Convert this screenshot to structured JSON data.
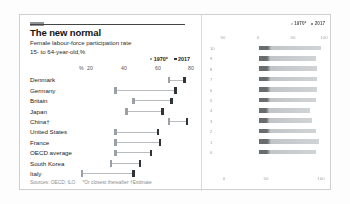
{
  "card": {
    "tag_color": "#8f9398",
    "title": "The new normal",
    "subtitle_1": "Female labour-force participation rate",
    "subtitle_2": "15- to 64-year-old,%",
    "legend": [
      {
        "label": "1970*",
        "color": "#9aa0a6"
      },
      {
        "label": "2017",
        "color": "#2f3437"
      }
    ],
    "axis": {
      "percent_symbol": "%",
      "ticks": [
        "20",
        "40",
        "60",
        "80"
      ]
    },
    "source": "Sources: OECD; ILO",
    "notes": "*Or closest thereafter †Estimate"
  },
  "right_panel": {
    "legend": [
      {
        "label": "1970*",
        "color": "#9aa0a6"
      },
      {
        "label": "2017",
        "color": "#2f3437"
      }
    ],
    "x_ticks_top": [
      "50",
      "0",
      "50",
      "100"
    ],
    "x_ticks_bottom": [
      "0",
      "50",
      "100"
    ],
    "y_ticks": [
      "10",
      "9",
      "8",
      "7",
      "6",
      "5",
      "4",
      "3",
      "2",
      "1",
      "0"
    ]
  },
  "chart_data": {
    "type": "bar",
    "title": "The new normal",
    "subtitle": "Female labour-force participation rate",
    "xlabel": "15- to 64-year-old,%",
    "ylabel": "",
    "xlim": [
      15,
      85
    ],
    "grid": false,
    "legend_position": "top-right",
    "categories": [
      "Denmark",
      "Germany",
      "Britain",
      "Japan",
      "China†",
      "United States",
      "France",
      "OECD average",
      "South Korea",
      "Italy"
    ],
    "series": [
      {
        "name": "1970*",
        "color": "#9aa0a6",
        "values": [
          72,
          48,
          56,
          53,
          72,
          48,
          48,
          48,
          46,
          33
        ]
      },
      {
        "name": "2017",
        "color": "#2f3437",
        "values": [
          79,
          75,
          73,
          69,
          80,
          67,
          68,
          64,
          59,
          56
        ]
      }
    ],
    "annotations": [
      "*Or closest thereafter",
      "†Estimate"
    ],
    "source": "Sources: OECD; ILO"
  }
}
